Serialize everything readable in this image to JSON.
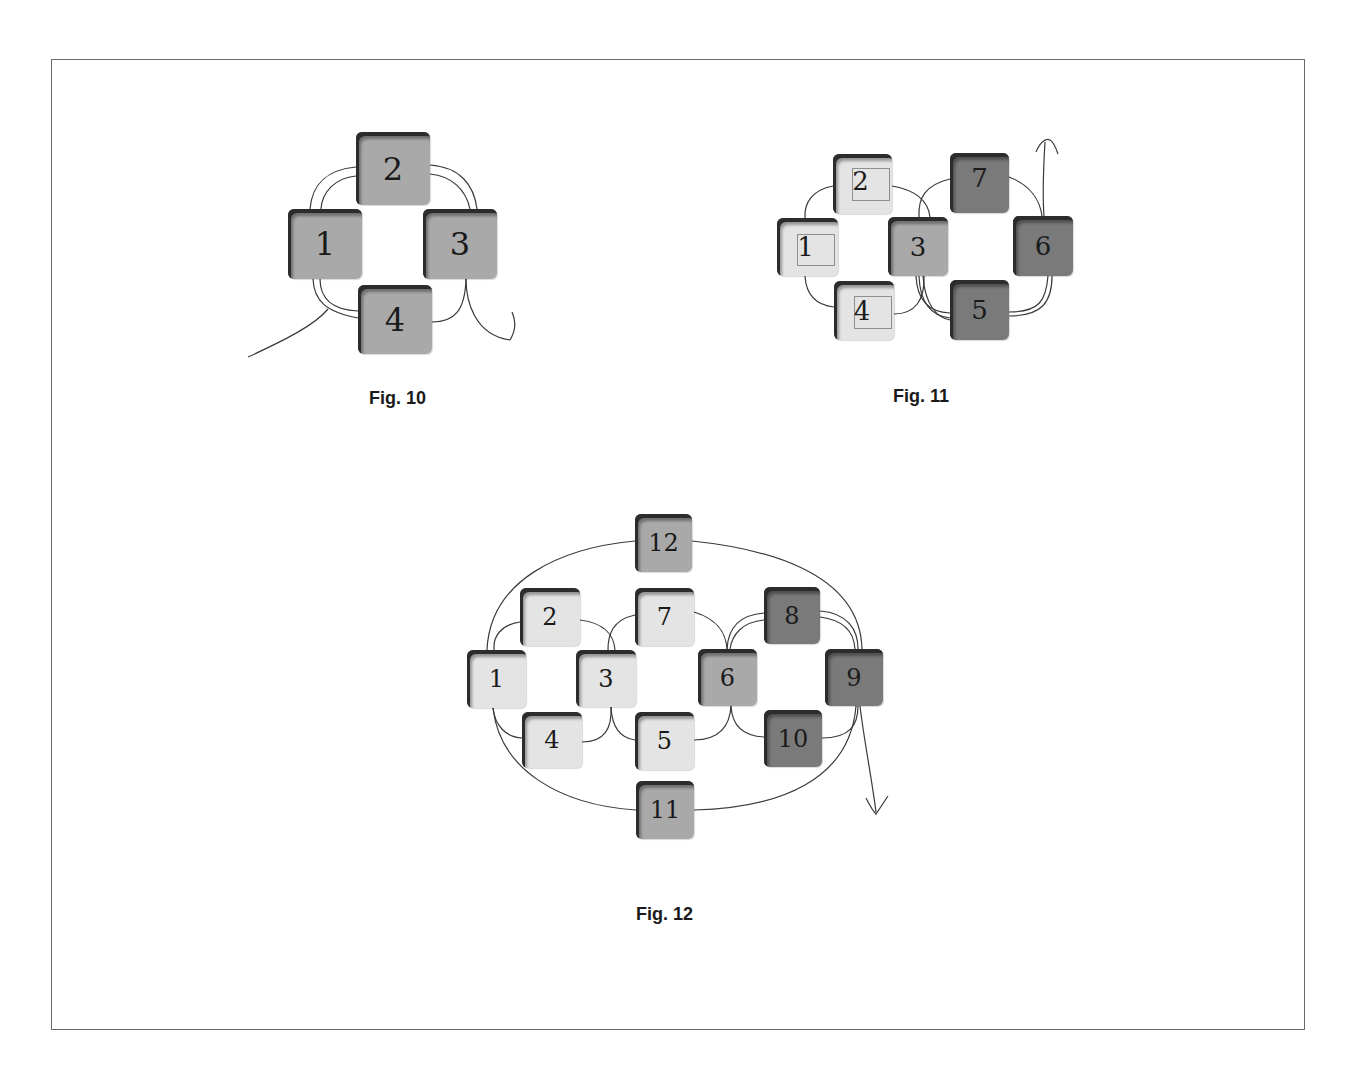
{
  "figures": [
    {
      "id": "fig10",
      "caption": "Fig. 10",
      "tiles": [
        {
          "label": "2",
          "shade": "mid",
          "color": "#a9a9a9"
        },
        {
          "label": "1",
          "shade": "mid",
          "color": "#a9a9a9"
        },
        {
          "label": "3",
          "shade": "mid",
          "color": "#a9a9a9"
        },
        {
          "label": "4",
          "shade": "mid",
          "color": "#a9a9a9"
        }
      ]
    },
    {
      "id": "fig11",
      "caption": "Fig. 11",
      "tiles": [
        {
          "label": "2",
          "shade": "light",
          "color": "#e4e4e4",
          "inner_box": true
        },
        {
          "label": "7",
          "shade": "dark",
          "color": "#7a7a7a"
        },
        {
          "label": "1",
          "shade": "light",
          "color": "#e4e4e4",
          "inner_box": true
        },
        {
          "label": "3",
          "shade": "mid",
          "color": "#a9a9a9"
        },
        {
          "label": "6",
          "shade": "dark",
          "color": "#7a7a7a"
        },
        {
          "label": "4",
          "shade": "light",
          "color": "#e4e4e4",
          "inner_box": true
        },
        {
          "label": "5",
          "shade": "dark",
          "color": "#7a7a7a"
        }
      ]
    },
    {
      "id": "fig12",
      "caption": "Fig. 12",
      "tiles": [
        {
          "label": "12",
          "shade": "mid",
          "color": "#a9a9a9"
        },
        {
          "label": "2",
          "shade": "light",
          "color": "#e4e4e4"
        },
        {
          "label": "7",
          "shade": "light",
          "color": "#e4e4e4"
        },
        {
          "label": "8",
          "shade": "dark",
          "color": "#7a7a7a"
        },
        {
          "label": "1",
          "shade": "light",
          "color": "#e4e4e4"
        },
        {
          "label": "3",
          "shade": "light",
          "color": "#e4e4e4"
        },
        {
          "label": "6",
          "shade": "mid",
          "color": "#a9a9a9"
        },
        {
          "label": "9",
          "shade": "dark",
          "color": "#7a7a7a"
        },
        {
          "label": "4",
          "shade": "light",
          "color": "#e4e4e4"
        },
        {
          "label": "5",
          "shade": "light",
          "color": "#e4e4e4"
        },
        {
          "label": "10",
          "shade": "dark",
          "color": "#7a7a7a"
        },
        {
          "label": "11",
          "shade": "mid",
          "color": "#a9a9a9"
        }
      ]
    }
  ],
  "colors": {
    "tile_light": "#e4e4e4",
    "tile_mid": "#a9a9a9",
    "tile_dark": "#7a7a7a",
    "thread": "#3a3a3a",
    "frame_border": "#6a6a6a"
  }
}
